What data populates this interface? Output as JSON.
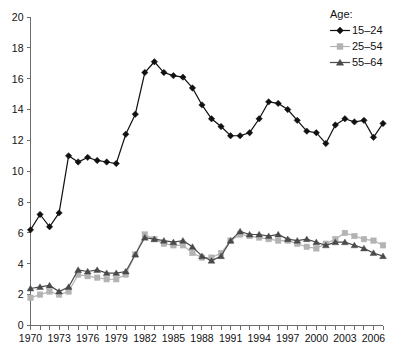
{
  "chart_data": {
    "type": "line",
    "title": "",
    "subtitle": "",
    "xlabel": "",
    "ylabel": "",
    "xlim": [
      1970,
      2007
    ],
    "ylim": [
      0,
      20
    ],
    "y_ticks": [
      0,
      2,
      4,
      6,
      8,
      10,
      12,
      14,
      16,
      18,
      20
    ],
    "x_ticks_labeled": [
      1970,
      1973,
      1976,
      1979,
      1982,
      1985,
      1988,
      1991,
      1994,
      1997,
      2000,
      2003,
      2006
    ],
    "x_tick_step": 1,
    "grid": false,
    "legend_position": "top-right",
    "legend_title": "Age:",
    "x": [
      1970,
      1971,
      1972,
      1973,
      1974,
      1975,
      1976,
      1977,
      1978,
      1979,
      1980,
      1981,
      1982,
      1983,
      1984,
      1985,
      1986,
      1987,
      1988,
      1989,
      1990,
      1991,
      1992,
      1993,
      1994,
      1995,
      1996,
      1997,
      1998,
      1999,
      2000,
      2001,
      2002,
      2003,
      2004,
      2005,
      2006,
      2007
    ],
    "series": [
      {
        "name": "15–24",
        "marker": "diamond",
        "color": "#111111",
        "values": [
          6.2,
          7.2,
          6.4,
          7.3,
          11.0,
          10.6,
          10.9,
          10.7,
          10.6,
          10.5,
          12.4,
          13.7,
          16.4,
          17.1,
          16.4,
          16.2,
          16.1,
          15.4,
          14.3,
          13.4,
          12.9,
          12.3,
          12.3,
          12.5,
          13.4,
          14.5,
          14.4,
          14.0,
          13.3,
          12.6,
          12.5,
          11.8,
          13.0,
          13.4,
          13.2,
          13.3,
          12.2,
          13.1
        ]
      },
      {
        "name": "25–54",
        "marker": "square",
        "color": "#b3b3b3",
        "values": [
          1.8,
          2.0,
          2.2,
          2.0,
          2.2,
          3.3,
          3.2,
          3.1,
          3.0,
          3.0,
          3.3,
          4.6,
          5.9,
          5.6,
          5.3,
          5.2,
          5.2,
          4.7,
          4.4,
          4.4,
          4.7,
          5.5,
          5.9,
          5.8,
          5.7,
          5.6,
          5.5,
          5.5,
          5.3,
          5.1,
          5.0,
          5.3,
          5.6,
          6.0,
          5.8,
          5.6,
          5.5,
          5.2
        ]
      },
      {
        "name": "55–64",
        "marker": "triangle",
        "color": "#4a4a4a",
        "values": [
          2.4,
          2.5,
          2.6,
          2.2,
          2.5,
          3.6,
          3.5,
          3.6,
          3.4,
          3.4,
          3.5,
          4.6,
          5.7,
          5.6,
          5.5,
          5.4,
          5.5,
          5.1,
          4.5,
          4.2,
          4.5,
          5.5,
          6.1,
          5.9,
          5.9,
          5.8,
          5.9,
          5.6,
          5.5,
          5.6,
          5.4,
          5.2,
          5.4,
          5.4,
          5.2,
          5.0,
          4.7,
          4.5
        ]
      }
    ]
  },
  "legend": {
    "title": "Age:",
    "entries": [
      {
        "label": "15–24"
      },
      {
        "label": "25–54"
      },
      {
        "label": "55–64"
      }
    ]
  },
  "axes": {
    "y_labels": [
      "20",
      "18",
      "16",
      "14",
      "12",
      "10",
      "8",
      "6",
      "4",
      "2",
      "0"
    ],
    "x_labels": [
      "1970",
      "1973",
      "1976",
      "1979",
      "1982",
      "1985",
      "1988",
      "1991",
      "1994",
      "1997",
      "2000",
      "2003",
      "2006"
    ]
  },
  "colors": {
    "series_15_24": "#111111",
    "series_25_54": "#b3b3b3",
    "series_55_64": "#4a4a4a",
    "axis": "#6b6b6b",
    "background": "#ffffff"
  }
}
